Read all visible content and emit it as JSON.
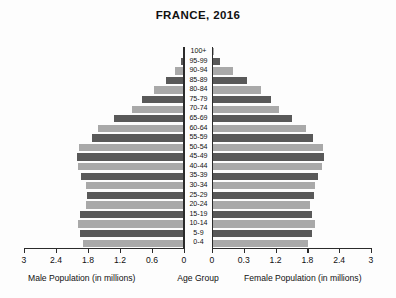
{
  "chart_data": {
    "type": "bar",
    "subtype": "population-pyramid",
    "title": "FRANCE, 2016",
    "xlabel_left": "Male Population (in millions)",
    "xlabel_center": "Age Group",
    "xlabel_right": "Female Population (in millions)",
    "ylabel": "Age Group",
    "grid": false,
    "legend": "none",
    "units": "millions",
    "xlim_left": [
      0,
      3
    ],
    "xlim_right": [
      0,
      3
    ],
    "left_ticks": [
      "3",
      "2.4",
      "1.8",
      "1.2",
      "0.6",
      "0"
    ],
    "left_tick_values": [
      3,
      2.4,
      1.8,
      1.2,
      0.6,
      0
    ],
    "right_ticks": [
      "0",
      "0.3",
      "1.2",
      "1.8",
      "2.4",
      "3"
    ],
    "right_tick_values": [
      0,
      0.6,
      1.2,
      1.8,
      2.4,
      3
    ],
    "categories": [
      "100+",
      "95-99",
      "90-94",
      "85-89",
      "80-84",
      "75-79",
      "70-74",
      "65-69",
      "60-64",
      "55-59",
      "50-54",
      "45-49",
      "40-44",
      "35-39",
      "30-34",
      "25-29",
      "20-24",
      "15-19",
      "10-14",
      "5-9",
      "0-4"
    ],
    "series": [
      {
        "name": "Male Population (in millions)",
        "side": "left",
        "values": [
          0.02,
          0.06,
          0.17,
          0.34,
          0.56,
          0.79,
          0.97,
          1.32,
          1.62,
          1.73,
          1.97,
          2.0,
          1.98,
          1.93,
          1.83,
          1.81,
          1.84,
          1.95,
          1.99,
          1.95,
          1.9
        ]
      },
      {
        "name": "Female Population (in millions)",
        "side": "right",
        "values": [
          0.03,
          0.15,
          0.39,
          0.66,
          0.93,
          1.12,
          1.26,
          1.5,
          1.77,
          1.9,
          2.1,
          2.12,
          2.08,
          2.0,
          1.94,
          1.93,
          1.85,
          1.88,
          1.95,
          1.89,
          1.82
        ]
      }
    ],
    "bar_colors": {
      "light": "#a9a9a9",
      "dark": "#595959"
    }
  },
  "background_color": "#fdfdfd",
  "text_color": "#111111"
}
